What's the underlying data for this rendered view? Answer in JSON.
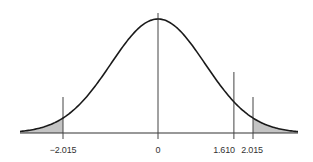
{
  "chart_data": {
    "type": "area",
    "title": "",
    "xlabel": "",
    "ylabel": "",
    "grid": false,
    "legend": null,
    "x_range": [
      -3.5,
      3.5
    ],
    "tick_labels": [
      "-2.015",
      "0",
      "1.610",
      "2.015"
    ],
    "tick_values": [
      -2.015,
      0,
      1.61,
      2.015
    ],
    "shaded_regions": [
      {
        "from": -3.5,
        "to": -2.015,
        "label": "left tail"
      },
      {
        "from": 2.015,
        "to": 3.5,
        "label": "right tail"
      }
    ],
    "vertical_lines": [
      {
        "x": -2.015,
        "label": "-2.015",
        "role": "critical-value"
      },
      {
        "x": 0,
        "label": "0",
        "role": "mean"
      },
      {
        "x": 1.61,
        "label": "1.610",
        "role": "test-statistic"
      },
      {
        "x": 2.015,
        "label": "2.015",
        "role": "critical-value"
      }
    ]
  },
  "labels": {
    "neg_crit": "−2.015",
    "zero": "0",
    "test_stat": "1.610",
    "pos_crit": "2.015"
  },
  "colors": {
    "curve": "#1a1a1a",
    "axis": "#333333",
    "shade": "#c8c8c8"
  }
}
